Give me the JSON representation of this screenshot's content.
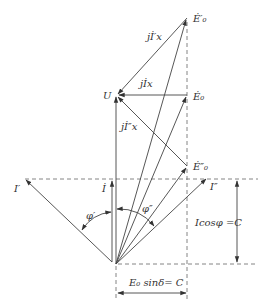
{
  "diagram": {
    "colors": {
      "line": "#444444",
      "dash": "#666666",
      "text": "#333333",
      "background": "#ffffff"
    },
    "labels": {
      "E0_prime": "Ė′₀",
      "E0": "Ė₀",
      "E0_double": "Ė″₀",
      "U": "U",
      "jI_prime_x": "jİ′x",
      "jI_x": "jİx",
      "jI_double_x": "jİ″x",
      "I_prime": "I′",
      "I": "İ",
      "I_double": "I″",
      "phi_prime": "φ′",
      "phi_double": "φ″",
      "Icos_phi": "Icosφ =C",
      "E0_sin_delta": "E₀ sinδ= C"
    },
    "points": {
      "origin": [
        116,
        264
      ],
      "U": [
        116,
        95
      ],
      "E0_prime": [
        187,
        18
      ],
      "E0": [
        187,
        95
      ],
      "E0_double": [
        187,
        166
      ],
      "I_tip": [
        112,
        179
      ],
      "I_prime_tip": [
        25,
        179
      ],
      "I_double_tip": [
        207,
        178
      ]
    }
  }
}
